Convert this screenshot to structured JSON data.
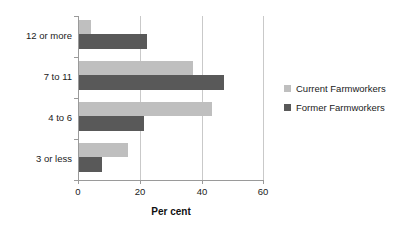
{
  "chart_data": {
    "type": "bar",
    "orientation": "horizontal",
    "title": "",
    "xlabel": "Per cent",
    "ylabel": "",
    "categories": [
      "3 or less",
      "4 to 6",
      "7 to 11",
      "12 or more"
    ],
    "series": [
      {
        "name": "Current Farmworkers",
        "color": "#bfbfbf",
        "values": [
          16,
          43,
          37,
          4
        ]
      },
      {
        "name": "Former Farmworkers",
        "color": "#595959",
        "values": [
          7.5,
          21,
          47,
          22
        ]
      }
    ],
    "xlim": [
      0,
      60
    ],
    "xticks": [
      0,
      20,
      40,
      60
    ],
    "xtick_labels": [
      "0",
      "20",
      "40",
      "60"
    ],
    "grid": "vertical",
    "legend_position": "right",
    "legend": [
      "Current Farmworkers",
      "Former Farmworkers"
    ]
  },
  "axis": {
    "x_title": "Per cent",
    "tick_0": "0",
    "tick_1": "20",
    "tick_2": "40",
    "tick_3": "60"
  },
  "categories": {
    "c0": "12 or more",
    "c1": "7 to 11",
    "c2": "4 to 6",
    "c3": "3 or less"
  },
  "legend": {
    "current": "Current Farmworkers",
    "former": "Former Farmworkers"
  }
}
